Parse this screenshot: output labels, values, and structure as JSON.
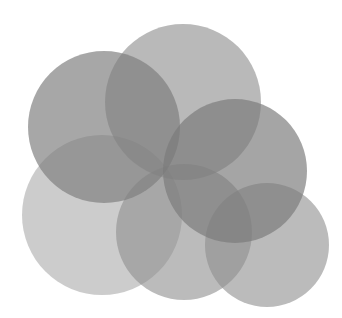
{
  "canvas": {
    "width": 342,
    "height": 318,
    "background": "#ffffff"
  },
  "circles": [
    {
      "id": "bottom-left",
      "cx": 102,
      "cy": 215,
      "r": 80,
      "fill": "#9a9a9a",
      "opacity": 0.5
    },
    {
      "id": "bottom-center",
      "cx": 184,
      "cy": 232,
      "r": 68,
      "fill": "#8e8e8e",
      "opacity": 0.6
    },
    {
      "id": "bottom-right",
      "cx": 267,
      "cy": 245,
      "r": 62,
      "fill": "#8e8e8e",
      "opacity": 0.6
    },
    {
      "id": "top-center",
      "cx": 183,
      "cy": 102,
      "r": 78,
      "fill": "#8e8e8e",
      "opacity": 0.62
    },
    {
      "id": "top-left",
      "cx": 104,
      "cy": 127,
      "r": 76,
      "fill": "#7e7e7e",
      "opacity": 0.68
    },
    {
      "id": "right-middle",
      "cx": 235,
      "cy": 171,
      "r": 72,
      "fill": "#7a7a7a",
      "opacity": 0.68
    }
  ]
}
